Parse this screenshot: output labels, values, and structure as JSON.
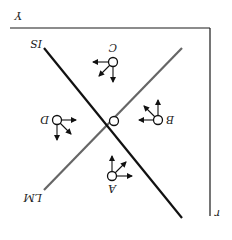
{
  "figure": {
    "orientation": "rotated 180 degrees",
    "axes": {
      "x_label": "Y",
      "y_label": "r"
    },
    "curves": [
      {
        "name": "IS",
        "label": "IS",
        "color": "#111111"
      },
      {
        "name": "LM",
        "label": "LM",
        "color": "#666666"
      }
    ],
    "equilibrium_point": "intersection of IS and LM",
    "points": [
      {
        "label": "A",
        "arrows": [
          "down",
          "down-left",
          "left"
        ]
      },
      {
        "label": "B",
        "arrows": [
          "down",
          "down-right",
          "right"
        ]
      },
      {
        "label": "C",
        "arrows": [
          "up",
          "up-right",
          "right"
        ]
      },
      {
        "label": "D",
        "arrows": [
          "up",
          "up-left",
          "left"
        ]
      }
    ]
  }
}
